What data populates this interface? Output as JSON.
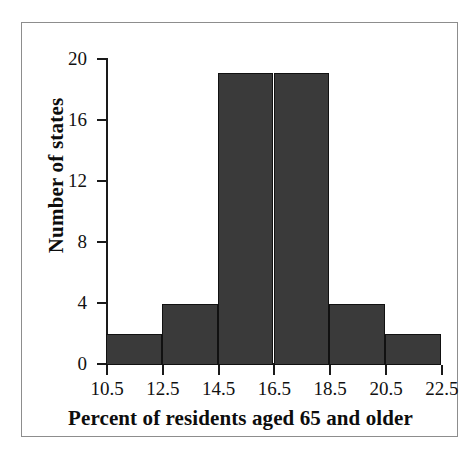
{
  "chart_data": {
    "type": "bar",
    "title": "",
    "subtitle": "",
    "xlabel": "Percent of residents aged 65 and older",
    "ylabel": "Number of states",
    "histogram": true,
    "bin_edges": [
      10.5,
      12.5,
      14.5,
      16.5,
      18.5,
      20.5,
      22.5
    ],
    "bin_width": 2,
    "categories": [
      "10.5-12.5",
      "12.5-14.5",
      "14.5-16.5",
      "16.5-18.5",
      "18.5-20.5",
      "20.5-22.5"
    ],
    "values": [
      2,
      4,
      19,
      19,
      4,
      2
    ],
    "xlim": [
      10.5,
      22.5
    ],
    "ylim": [
      0,
      20
    ],
    "xticks": [
      "10.5",
      "12.5",
      "14.5",
      "16.5",
      "18.5",
      "20.5",
      "22.5"
    ],
    "xtick_values": [
      10.5,
      12.5,
      14.5,
      16.5,
      18.5,
      20.5,
      22.5
    ],
    "yticks": [
      "0",
      "4",
      "8",
      "12",
      "16",
      "20"
    ],
    "ytick_values": [
      0,
      4,
      8,
      12,
      16,
      20
    ],
    "grid": false,
    "legend": null,
    "bar_fill_color": "#3a3a3a",
    "bar_edge_color": "#111111",
    "axis_color": "#1a1a1a",
    "frame_color": "#8d8d8d",
    "background_color": "#ffffff",
    "total_count": 50
  }
}
